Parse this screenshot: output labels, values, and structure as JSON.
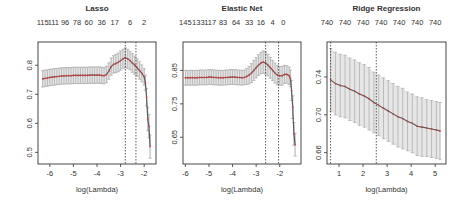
{
  "chart_data": [
    {
      "type": "line",
      "title": "Lasso",
      "xlabel": "log(Lambda)",
      "ylabel": "",
      "xticks": [
        -6,
        -5,
        -4,
        -3,
        -2
      ],
      "xtick_labels": [
        "-6",
        "-5",
        "-4",
        "-3",
        "-2"
      ],
      "yticks": [
        0.5,
        0.6,
        0.7,
        0.8
      ],
      "ytick_labels": [
        "0.5",
        "0.6",
        "0.7",
        "0.8"
      ],
      "top_ticks": [
        -6.3,
        -5.85,
        -5.35,
        -4.85,
        -4.35,
        -3.8,
        -3.25,
        -2.6,
        -2.0
      ],
      "top_labels": [
        "115",
        "111",
        "96",
        "78",
        "60",
        "36",
        "17",
        "6",
        "2"
      ],
      "xlim": [
        -6.5,
        -1.5
      ],
      "ylim": [
        0.46,
        0.88
      ],
      "vlines": [
        -2.8,
        -2.35
      ],
      "box": {
        "x0": 38,
        "y0": 42,
        "x1": 156,
        "y1": 164
      },
      "x": [
        -6.3,
        -6.2,
        -6.1,
        -6.0,
        -5.9,
        -5.8,
        -5.7,
        -5.6,
        -5.5,
        -5.4,
        -5.3,
        -5.2,
        -5.1,
        -5.0,
        -4.9,
        -4.8,
        -4.7,
        -4.6,
        -4.5,
        -4.4,
        -4.3,
        -4.2,
        -4.1,
        -4.0,
        -3.9,
        -3.8,
        -3.7,
        -3.6,
        -3.5,
        -3.4,
        -3.3,
        -3.2,
        -3.1,
        -3.0,
        -2.9,
        -2.8,
        -2.7,
        -2.6,
        -2.5,
        -2.4,
        -2.3,
        -2.2,
        -2.1,
        -2.0,
        -1.95,
        -1.9,
        -1.85,
        -1.8,
        -1.75
      ],
      "y": [
        0.753,
        0.755,
        0.756,
        0.758,
        0.759,
        0.76,
        0.761,
        0.762,
        0.763,
        0.763,
        0.764,
        0.764,
        0.764,
        0.765,
        0.765,
        0.765,
        0.765,
        0.765,
        0.765,
        0.765,
        0.766,
        0.766,
        0.766,
        0.766,
        0.766,
        0.765,
        0.764,
        0.768,
        0.78,
        0.795,
        0.803,
        0.806,
        0.81,
        0.816,
        0.822,
        0.826,
        0.822,
        0.816,
        0.808,
        0.8,
        0.792,
        0.782,
        0.772,
        0.76,
        0.74,
        0.69,
        0.615,
        0.59,
        0.52
      ],
      "err": [
        0.028,
        0.028,
        0.028,
        0.028,
        0.028,
        0.028,
        0.028,
        0.028,
        0.028,
        0.028,
        0.028,
        0.028,
        0.028,
        0.028,
        0.028,
        0.028,
        0.028,
        0.028,
        0.028,
        0.028,
        0.028,
        0.028,
        0.028,
        0.028,
        0.028,
        0.028,
        0.028,
        0.028,
        0.028,
        0.03,
        0.03,
        0.031,
        0.032,
        0.033,
        0.033,
        0.034,
        0.033,
        0.032,
        0.032,
        0.031,
        0.03,
        0.03,
        0.029,
        0.028,
        0.026,
        0.03,
        0.04,
        0.04,
        0.04
      ]
    },
    {
      "type": "line",
      "title": "Elastic Net",
      "xlabel": "log(Lambda)",
      "ylabel": "",
      "xticks": [
        -6,
        -5,
        -4,
        -3,
        -2
      ],
      "xtick_labels": [
        "-6",
        "-5",
        "-4",
        "-3",
        "-2"
      ],
      "yticks": [
        0.65,
        0.75,
        0.85
      ],
      "ytick_labels": [
        "0.65",
        "0.75",
        "0.85"
      ],
      "top_ticks": [
        -6.0,
        -5.45,
        -4.95,
        -4.4,
        -3.85,
        -3.3,
        -2.8,
        -2.3,
        -1.85
      ],
      "top_labels": [
        "145",
        "133",
        "117",
        "83",
        "64",
        "33",
        "16",
        "4",
        "0"
      ],
      "xlim": [
        -6.1,
        -1.1
      ],
      "ylim": [
        0.57,
        0.935
      ],
      "vlines": [
        -2.6,
        -2.05
      ],
      "box": {
        "x0": 183,
        "y0": 42,
        "x1": 301,
        "y1": 164
      },
      "x": [
        -6.0,
        -5.9,
        -5.8,
        -5.7,
        -5.6,
        -5.5,
        -5.4,
        -5.3,
        -5.2,
        -5.1,
        -5.0,
        -4.9,
        -4.8,
        -4.7,
        -4.6,
        -4.5,
        -4.4,
        -4.3,
        -4.2,
        -4.1,
        -4.0,
        -3.9,
        -3.8,
        -3.7,
        -3.6,
        -3.5,
        -3.4,
        -3.3,
        -3.2,
        -3.1,
        -3.0,
        -2.9,
        -2.8,
        -2.7,
        -2.6,
        -2.5,
        -2.4,
        -2.3,
        -2.2,
        -2.1,
        -2.0,
        -1.9,
        -1.8,
        -1.7,
        -1.6,
        -1.55,
        -1.5,
        -1.45,
        -1.4,
        -1.35
      ],
      "y": [
        0.828,
        0.828,
        0.828,
        0.828,
        0.828,
        0.828,
        0.829,
        0.829,
        0.829,
        0.829,
        0.83,
        0.83,
        0.829,
        0.829,
        0.828,
        0.828,
        0.828,
        0.829,
        0.829,
        0.83,
        0.83,
        0.83,
        0.829,
        0.829,
        0.828,
        0.829,
        0.832,
        0.836,
        0.842,
        0.85,
        0.858,
        0.866,
        0.872,
        0.875,
        0.872,
        0.866,
        0.858,
        0.85,
        0.842,
        0.836,
        0.834,
        0.834,
        0.838,
        0.838,
        0.834,
        0.826,
        0.79,
        0.74,
        0.66,
        0.628
      ],
      "err": [
        0.022,
        0.022,
        0.022,
        0.022,
        0.022,
        0.022,
        0.022,
        0.022,
        0.022,
        0.022,
        0.022,
        0.022,
        0.022,
        0.022,
        0.022,
        0.022,
        0.022,
        0.022,
        0.022,
        0.022,
        0.022,
        0.022,
        0.022,
        0.022,
        0.022,
        0.022,
        0.024,
        0.026,
        0.028,
        0.03,
        0.03,
        0.031,
        0.032,
        0.033,
        0.033,
        0.032,
        0.031,
        0.03,
        0.03,
        0.029,
        0.028,
        0.028,
        0.027,
        0.026,
        0.026,
        0.025,
        0.03,
        0.034,
        0.034,
        0.034
      ]
    },
    {
      "type": "line",
      "title": "Ridge Regression",
      "xlabel": "log(Lambda)",
      "ylabel": "",
      "xticks": [
        1,
        2,
        3,
        4,
        5
      ],
      "xtick_labels": [
        "1",
        "2",
        "3",
        "4",
        "5"
      ],
      "yticks": [
        0.66,
        0.7,
        0.74
      ],
      "ytick_labels": [
        "0.66",
        "0.70",
        "0.74"
      ],
      "top_ticks": [
        0.5,
        1.25,
        2.0,
        2.75,
        3.5,
        4.25,
        5.0
      ],
      "top_labels": [
        "740",
        "740",
        "740",
        "740",
        "740",
        "740",
        "740"
      ],
      "xlim": [
        0.5,
        5.45
      ],
      "ylim": [
        0.648,
        0.777
      ],
      "vlines": [
        0.65,
        2.55
      ],
      "box": {
        "x0": 327,
        "y0": 42,
        "x1": 446,
        "y1": 164
      },
      "x": [
        0.65,
        0.85,
        1.05,
        1.25,
        1.45,
        1.65,
        1.85,
        2.05,
        2.25,
        2.45,
        2.65,
        2.85,
        3.05,
        3.25,
        3.45,
        3.65,
        3.85,
        4.05,
        4.25,
        4.45,
        4.65,
        4.85,
        5.05,
        5.2
      ],
      "y": [
        0.737,
        0.733,
        0.731,
        0.73,
        0.727,
        0.725,
        0.722,
        0.72,
        0.717,
        0.713,
        0.71,
        0.707,
        0.704,
        0.701,
        0.698,
        0.696,
        0.693,
        0.691,
        0.688,
        0.687,
        0.686,
        0.685,
        0.684,
        0.683
      ],
      "err": [
        0.033,
        0.033,
        0.033,
        0.033,
        0.033,
        0.033,
        0.033,
        0.033,
        0.033,
        0.032,
        0.032,
        0.032,
        0.032,
        0.032,
        0.032,
        0.032,
        0.031,
        0.031,
        0.031,
        0.031,
        0.03,
        0.03,
        0.03,
        0.03
      ]
    }
  ]
}
